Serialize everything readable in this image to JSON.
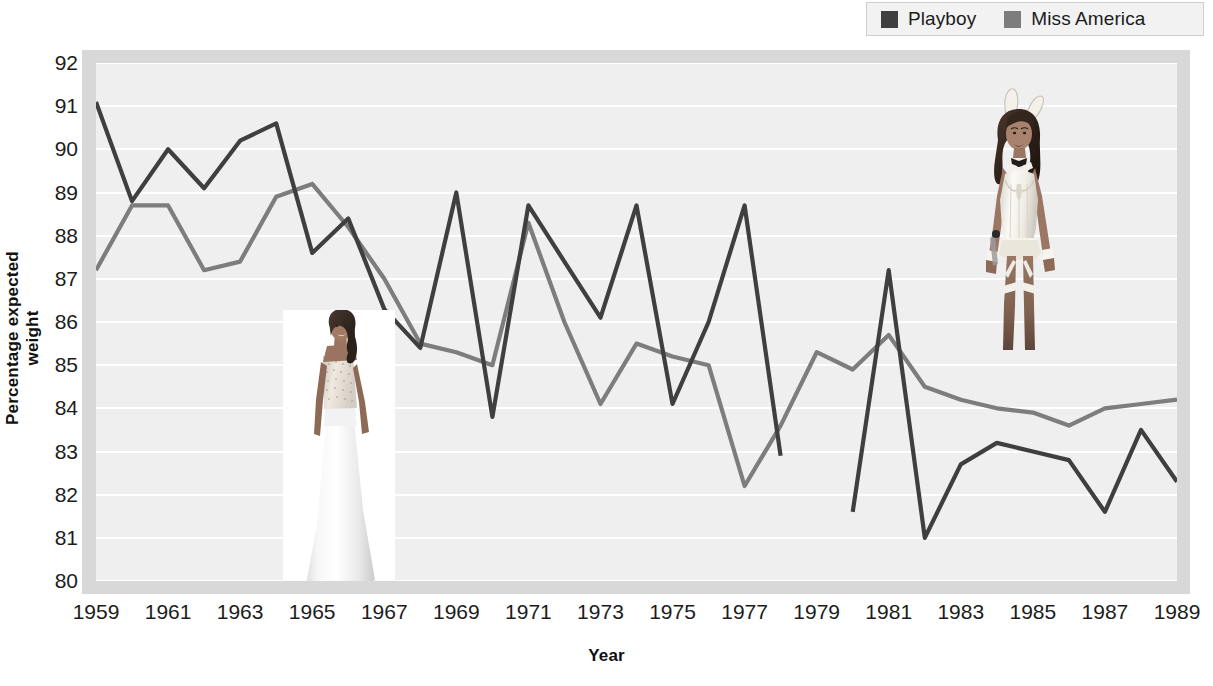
{
  "legend": {
    "position": "top-right",
    "entries": [
      {
        "label": "Playboy",
        "color": "#3f3f3f",
        "swatch_icon": "square-swatch-icon"
      },
      {
        "label": "Miss America",
        "color": "#7d7d7d",
        "swatch_icon": "square-swatch-icon"
      }
    ]
  },
  "axes": {
    "ylabel": "Percentage expected weight",
    "xlabel": "Year",
    "yticks": [
      "80",
      "81",
      "82",
      "83",
      "84",
      "85",
      "86",
      "87",
      "88",
      "89",
      "90",
      "91",
      "92"
    ],
    "xticks": [
      "1959",
      "1961",
      "1963",
      "1965",
      "1967",
      "1969",
      "1971",
      "1973",
      "1975",
      "1977",
      "1979",
      "1981",
      "1983",
      "1985",
      "1987",
      "1989"
    ]
  },
  "photos": [
    {
      "name": "miss-america-contestant-photo",
      "alt": "Miss America contestant in a long white evening gown"
    },
    {
      "name": "playboy-bunny-photo",
      "alt": "Playboy Bunny in a white bunny costume with ears and bow tie"
    }
  ],
  "chart_data": {
    "type": "line",
    "title": "",
    "xlabel": "Year",
    "ylabel": "Percentage expected weight",
    "xlim": [
      1959,
      1989
    ],
    "ylim": [
      80,
      92
    ],
    "grid": "horizontal",
    "legend_position": "top-right",
    "x": [
      1959,
      1960,
      1961,
      1962,
      1963,
      1964,
      1965,
      1966,
      1967,
      1968,
      1969,
      1970,
      1971,
      1972,
      1973,
      1974,
      1975,
      1976,
      1977,
      1978,
      1979,
      1980,
      1981,
      1982,
      1983,
      1984,
      1985,
      1986,
      1987,
      1988,
      1989
    ],
    "series": [
      {
        "name": "Playboy",
        "color": "#3f3f3f",
        "values": [
          91.1,
          88.8,
          90.0,
          89.1,
          90.2,
          90.6,
          87.6,
          88.4,
          86.3,
          85.4,
          89.0,
          83.8,
          88.7,
          87.4,
          86.1,
          88.7,
          84.1,
          86.0,
          88.7,
          82.9,
          null,
          81.6,
          87.2,
          81.0,
          82.7,
          83.2,
          83.0,
          82.8,
          81.6,
          83.5,
          82.3
        ]
      },
      {
        "name": "Miss America",
        "color": "#7d7d7d",
        "values": [
          87.2,
          88.7,
          88.7,
          87.2,
          87.4,
          88.9,
          89.2,
          88.2,
          87.0,
          85.5,
          85.3,
          85.0,
          88.3,
          86.0,
          84.1,
          85.5,
          85.2,
          85.0,
          82.2,
          83.6,
          85.3,
          84.9,
          85.7,
          84.5,
          84.2,
          84.0,
          83.9,
          83.6,
          84.0,
          84.1,
          84.2
        ]
      }
    ]
  }
}
